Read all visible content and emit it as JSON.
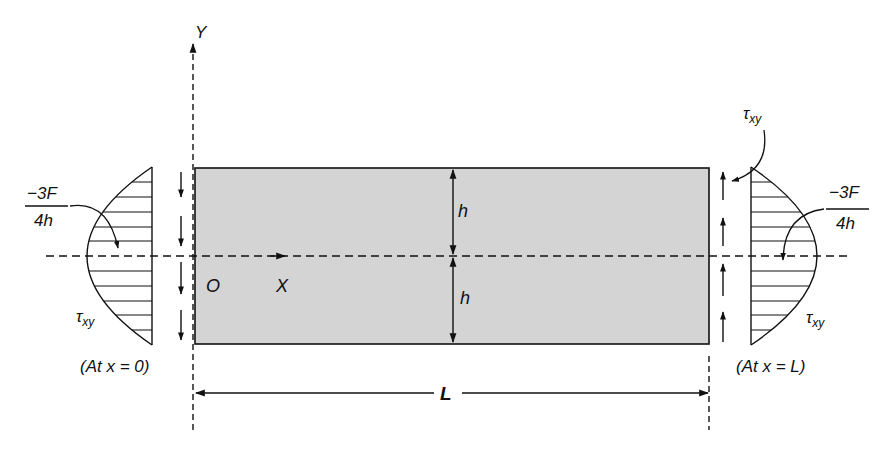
{
  "diagram": {
    "type": "beam shear stress distribution",
    "colors": {
      "beam_fill": "#d4d4d4",
      "ink": "#111111",
      "background": "#ffffff"
    },
    "axes": {
      "y_label": "Y",
      "x_label": "X",
      "origin_label": "O"
    },
    "dimensions": {
      "half_depth_top": "h",
      "half_depth_bottom": "h",
      "length": "L"
    },
    "left_end": {
      "peak_value_numerator": "−3F",
      "peak_value_denominator": "4h",
      "stress_symbol": "τ",
      "stress_subscript": "xy",
      "caption": "(At x = 0)",
      "arrow_direction": "down",
      "arrow_count": 4
    },
    "right_end": {
      "peak_value_numerator": "−3F",
      "peak_value_denominator": "4h",
      "stress_symbol": "τ",
      "stress_subscript": "xy",
      "top_stress_symbol": "τ",
      "top_stress_subscript": "xy",
      "caption": "(At x = L)",
      "arrow_direction": "up",
      "arrow_count": 4
    }
  }
}
